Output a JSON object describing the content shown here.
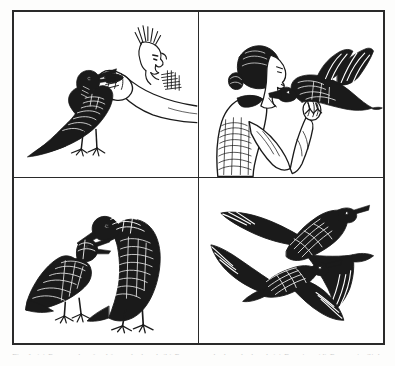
{
  "figure": {
    "kind": "four-panel-plate",
    "medium": "pen-and-ink line drawing",
    "palette": {
      "ink": "#1a1a1a",
      "paper": "#ffffff",
      "page_background": "#fdfdfc",
      "frame": "#2a2a2a",
      "caption_text": "#8d8d8d"
    },
    "frame": {
      "outer_border_px": 2.5,
      "divider_px": 1.6,
      "columns": 2,
      "rows": 2
    },
    "caption": {
      "text": "Fig. 1. (a) Raven takes food from the hand. (b) Raven perched on the hand. (c) Begging. (d) Ravens in flight.",
      "clipped": "true",
      "note": "Caption is cropped by the bottom edge of the screenshot; only the faint tops of the letters are visible."
    },
    "panels": [
      {
        "id": "panel-a",
        "position": "top-left",
        "label": "a",
        "title": "Raven taking food from a hand",
        "subjects": [
          "raven standing on ground",
          "human hand offering food",
          "sketched human head in profile"
        ],
        "description": "A raven stands at left with its beak open, reaching up toward a loosely sketched human hand that extends from the upper right offering a morsel. A faint profile of a face and hair is indicated above the hand."
      },
      {
        "id": "panel-b",
        "position": "top-right",
        "label": "b",
        "title": "Raven perched on a person's hand",
        "subjects": [
          "woman in profile, hair tied back",
          "raven perched on hand, wings raised"
        ],
        "description": "A woman shown in left-facing profile holds out her forearm; a raven perches on her hand, body dark and solid with tail fanned and wings slightly lifted, facing her."
      },
      {
        "id": "panel-c",
        "position": "bottom-left",
        "label": "c",
        "title": "Begging posture between two ravens",
        "subjects": [
          "juvenile raven crouching, gaping",
          "adult raven standing upright"
        ],
        "description": "Two ravens on the ground: the left bird crouches low with wings quivering and bill gaping in a begging posture, while the right bird stands tall and leans its head down toward it."
      },
      {
        "id": "panel-d",
        "position": "bottom-right",
        "label": "d",
        "title": "Two ravens in flight",
        "subjects": [
          "raven in flight, upper",
          "raven in flight, lower"
        ],
        "description": "Two ravens shown as bold silhouettes in flight, wings fully outstretched and tails wedge-shaped, with hatched highlights along the back and nape of each bird."
      }
    ]
  }
}
